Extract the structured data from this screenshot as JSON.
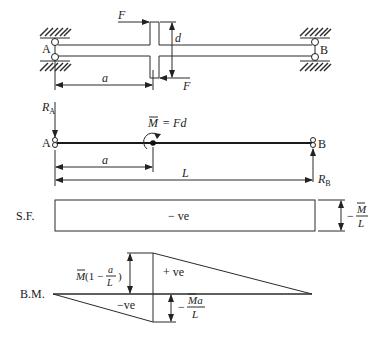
{
  "top_diagram": {
    "support_left_label": "A",
    "support_right_label": "B",
    "force_top_label": "F",
    "force_bottom_label": "F",
    "offset_label": "d",
    "distance_label": "a"
  },
  "loading_diagram": {
    "reaction_left_label": "R",
    "reaction_left_sub": "A",
    "reaction_right_label": "R",
    "reaction_right_sub": "B",
    "support_left_label": "A",
    "support_right_label": "B",
    "moment_label": "M = Fd",
    "moment_symbol": "M",
    "moment_eq": "= Fd",
    "distance_a_label": "a",
    "span_label": "L"
  },
  "shear_force_diagram": {
    "row_label": "S.F.",
    "sign_label": "− ve",
    "magnitude_prefix": "−",
    "magnitude_num": "M",
    "magnitude_den": "L"
  },
  "bending_moment_diagram": {
    "row_label": "B.M.",
    "positive_label": "+ ve",
    "negative_label": "−ve",
    "positive_value_M": "M",
    "positive_value_rest": "(1 −",
    "positive_value_frac_num": "a",
    "positive_value_frac_den": "L",
    "positive_value_close": ")",
    "negative_value_prefix": "−",
    "negative_value_num": "Ma",
    "negative_value_den": "L"
  }
}
